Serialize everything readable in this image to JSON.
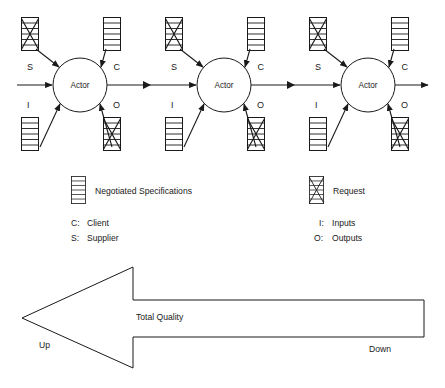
{
  "diagram": {
    "colors": {
      "stroke": "#1a1a1a",
      "fill": "#ffffff",
      "background": "#ffffff"
    },
    "actors": [
      {
        "id": "actor-1",
        "label": "Actor",
        "ports": {
          "supplier": "S",
          "client": "C",
          "inputs": "I",
          "outputs": "O"
        },
        "top_left_symbol": "request",
        "top_right_symbol": "negotiated-specifications",
        "bottom_left_symbol": "negotiated-specifications",
        "bottom_right_symbol": "request"
      },
      {
        "id": "actor-2",
        "label": "Actor",
        "ports": {
          "supplier": "S",
          "client": "C",
          "inputs": "I",
          "outputs": "O"
        },
        "top_left_symbol": "request",
        "top_right_symbol": "negotiated-specifications",
        "bottom_left_symbol": "negotiated-specifications",
        "bottom_right_symbol": "request"
      },
      {
        "id": "actor-3",
        "label": "Actor",
        "ports": {
          "supplier": "S",
          "client": "C",
          "inputs": "I",
          "outputs": "O"
        },
        "top_left_symbol": "request",
        "top_right_symbol": "negotiated-specifications",
        "bottom_left_symbol": "negotiated-specifications",
        "bottom_right_symbol": "request"
      }
    ],
    "legend": {
      "symbols": [
        {
          "icon": "negotiated-specifications-icon",
          "label": "Negotiated Specifications"
        },
        {
          "icon": "request-icon",
          "label": "Request"
        }
      ],
      "abbreviations_left": [
        {
          "key": "C:",
          "label": "Client"
        },
        {
          "key": "S:",
          "label": "Supplier"
        }
      ],
      "abbreviations_right": [
        {
          "key": "I:",
          "label": "Inputs"
        },
        {
          "key": "O:",
          "label": "Outputs"
        }
      ]
    },
    "quality_arrow": {
      "label": "Total Quality",
      "tip_label": "Up",
      "tail_label": "Down",
      "direction": "left"
    }
  }
}
